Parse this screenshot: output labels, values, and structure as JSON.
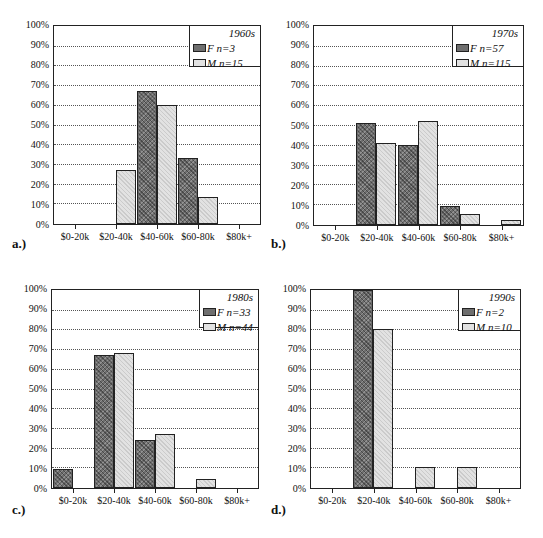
{
  "chart_data": [
    {
      "type": "bar",
      "panel_label": "a.)",
      "legend_title": "1960s",
      "categories": [
        "$0-20k",
        "$20-40k",
        "$40-60k",
        "$60-80k",
        "$80k+"
      ],
      "series": [
        {
          "name": "F n=3",
          "values": [
            0,
            0,
            67,
            33,
            0
          ]
        },
        {
          "name": "M n=15",
          "values": [
            0,
            27,
            60,
            13,
            0
          ]
        }
      ],
      "yticks": [
        "0%",
        "10%",
        "20%",
        "30%",
        "40%",
        "50%",
        "60%",
        "70%",
        "80%",
        "90%",
        "100%"
      ],
      "ylim": [
        0,
        100
      ],
      "grid": true,
      "legend_position": "top-right"
    },
    {
      "type": "bar",
      "panel_label": "b.)",
      "legend_title": "1970s",
      "categories": [
        "$0-20k",
        "$20-40k",
        "$40-60k",
        "$60-80k",
        "$80k+"
      ],
      "series": [
        {
          "name": "F n=57",
          "values": [
            0,
            51,
            40,
            9,
            0
          ]
        },
        {
          "name": "M n=115",
          "values": [
            0,
            41,
            52,
            5,
            2
          ]
        }
      ],
      "yticks": [
        "0%",
        "10%",
        "20%",
        "30%",
        "40%",
        "50%",
        "60%",
        "70%",
        "80%",
        "90%",
        "100%"
      ],
      "ylim": [
        0,
        100
      ],
      "grid": true,
      "legend_position": "top-right"
    },
    {
      "type": "bar",
      "panel_label": "c.)",
      "legend_title": "1980s",
      "categories": [
        "$0-20k",
        "$20-40k",
        "$40-60k",
        "$60-80k",
        "$80k+"
      ],
      "series": [
        {
          "name": "F n=33",
          "values": [
            9,
            67,
            24,
            0,
            0
          ]
        },
        {
          "name": "M n=44",
          "values": [
            0,
            68,
            27,
            4,
            0
          ]
        }
      ],
      "yticks": [
        "0%",
        "10%",
        "20%",
        "30%",
        "40%",
        "50%",
        "60%",
        "70%",
        "80%",
        "90%",
        "100%"
      ],
      "ylim": [
        0,
        100
      ],
      "grid": true,
      "legend_position": "top-right"
    },
    {
      "type": "bar",
      "panel_label": "d.)",
      "legend_title": "1990s",
      "categories": [
        "$0-20k",
        "$20-40k",
        "$40-60k",
        "$60-80k",
        "$80k+"
      ],
      "series": [
        {
          "name": "F n=2",
          "values": [
            0,
            100,
            0,
            0,
            0
          ]
        },
        {
          "name": "M n=10",
          "values": [
            0,
            80,
            10,
            10,
            0
          ]
        }
      ],
      "yticks": [
        "0%",
        "10%",
        "20%",
        "30%",
        "40%",
        "50%",
        "60%",
        "70%",
        "80%",
        "90%",
        "100%"
      ],
      "ylim": [
        0,
        100
      ],
      "grid": true,
      "legend_position": "top-right"
    }
  ],
  "colors": {
    "female": "#6e6e6e",
    "male": "#e2e2e2",
    "axis": "#222222"
  }
}
